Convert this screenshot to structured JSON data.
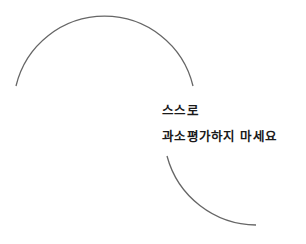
{
  "caption": {
    "line1": "스스로",
    "line2": "과소평가하지 마세요"
  },
  "colors": {
    "background": "#ffffff",
    "arc_stroke": "#666666",
    "text": "#1a1a1a"
  }
}
